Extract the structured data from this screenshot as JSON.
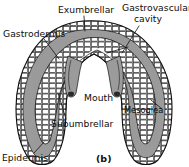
{
  "figure": {
    "caption": "(b)",
    "organism_stage": "medusa",
    "background_color": "#ffffff",
    "ink_color": "#111111",
    "mesoglea_fill": "#9b9b9b",
    "epithelium_fill": "#ffffff"
  },
  "labels": [
    {
      "id": "exumbrellar",
      "text": "Exumbrellar",
      "x": 58,
      "y": 12,
      "anchor": "start",
      "leader": [
        [
          84,
          16
        ],
        [
          84,
          30
        ]
      ]
    },
    {
      "id": "gastrovascular-cavity",
      "text_line1": "Gastrovascular",
      "text_line2": "cavity",
      "x": 122,
      "y": 11,
      "y2": 22,
      "anchor": "start",
      "leader": [
        [
          140,
          26
        ],
        [
          122,
          52
        ]
      ],
      "leader2": [
        [
          108,
          52
        ],
        [
          128,
          46
        ]
      ]
    },
    {
      "id": "gastrodermis",
      "text": "Gastrodermis",
      "x": 4,
      "y": 36,
      "anchor": "start",
      "leader": [
        [
          44,
          40
        ],
        [
          58,
          58
        ]
      ]
    },
    {
      "id": "mouth",
      "text": "Mouth",
      "x": 84,
      "y": 100,
      "anchor": "start",
      "leader": []
    },
    {
      "id": "mesoglea",
      "text": "Mesoglea",
      "x": 124,
      "y": 112,
      "anchor": "start",
      "leader": [
        [
          162,
          109
        ],
        [
          152,
          100
        ]
      ]
    },
    {
      "id": "subumbrellar",
      "text": "Subumbrellar",
      "x": 52,
      "y": 126,
      "anchor": "start",
      "leader": [
        [
          66,
          118
        ],
        [
          58,
          92
        ]
      ]
    },
    {
      "id": "epidermis",
      "text": "Epidermis",
      "x": 2,
      "y": 160,
      "anchor": "start",
      "leader": [
        [
          34,
          152
        ],
        [
          44,
          142
        ]
      ]
    }
  ],
  "anatomy_parts": [
    "exumbrellar surface",
    "subumbrellar surface",
    "gastrovascular cavity",
    "gastrodermis",
    "epidermis",
    "mesoglea",
    "mouth"
  ]
}
